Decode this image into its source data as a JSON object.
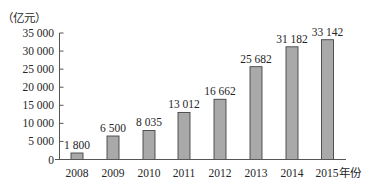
{
  "chart_data": {
    "type": "bar",
    "title": "",
    "ylabel": "（亿元）",
    "xlabel": "年份",
    "categories": [
      "2008",
      "2009",
      "2010",
      "2011",
      "2012",
      "2013",
      "2014",
      "2015"
    ],
    "values": [
      1800,
      6500,
      8035,
      13012,
      16662,
      25682,
      31182,
      33142
    ],
    "value_labels": [
      "1 800",
      "6 500",
      "8 035",
      "13 012",
      "16 662",
      "25 682",
      "31 182",
      "33 142"
    ],
    "x_tick_labels": [
      "2008",
      "2009",
      "2010",
      "2011",
      "2012",
      "2013",
      "2014",
      "2015年份"
    ],
    "y_ticks": [
      0,
      5000,
      10000,
      15000,
      20000,
      25000,
      30000,
      35000
    ],
    "y_tick_labels": [
      "0",
      "5 000",
      "10 000",
      "15 000",
      "20 000",
      "25 000",
      "30 000",
      "35 000"
    ],
    "ylim": [
      0,
      35000
    ],
    "grid": false,
    "legend": null,
    "colors": {
      "bar_fill": "#a9a9a9",
      "bar_stroke": "#444444",
      "axis": "#555555"
    }
  }
}
